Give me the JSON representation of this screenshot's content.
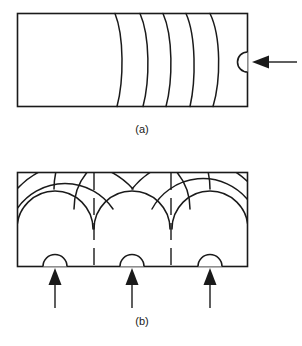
{
  "figure": {
    "background_color": "#ffffff",
    "line_color": "#1a1a1a",
    "panels": [
      {
        "id": "a",
        "caption": "(a)",
        "caption_x": 142,
        "caption_y": 133,
        "description": "Rectangular medium with four curved wavefronts and a single semicircular source on the right edge, with one arrow indicating the incoming direction",
        "box": {
          "x": 17,
          "y": 13,
          "width": 231,
          "height": 94
        },
        "wavefronts": [
          {
            "top_x": 115,
            "mid_x": 118,
            "bottom_x": 117
          },
          {
            "top_x": 140,
            "mid_x": 135,
            "bottom_x": 143
          },
          {
            "top_x": 163,
            "mid_x": 152,
            "bottom_x": 166
          },
          {
            "top_x": 186,
            "mid_x": 168,
            "bottom_x": 190
          },
          {
            "top_x": 210,
            "mid_x": 190,
            "bottom_x": 213
          }
        ],
        "source": {
          "label": "aperture-source",
          "center_x": 248,
          "center_y": 62,
          "radius": 10,
          "bulge": "left"
        },
        "arrows": [
          {
            "label": "incident-arrow",
            "tip_x": 252,
            "tip_y": 62,
            "tail_x": 297,
            "tail_y": 62,
            "direction": "left"
          }
        ]
      },
      {
        "id": "b",
        "caption": "(b)",
        "caption_x": 142,
        "caption_y": 325,
        "description": "Rectangular medium with three semicircular sources on the bottom edge, each emitting three nested circular wavefronts that intersect in cusps along two vertical lines",
        "box": {
          "x": 17,
          "y": 172,
          "width": 231,
          "height": 95
        },
        "sources": [
          {
            "label": "source-1",
            "center_x": 55,
            "center_y": 267,
            "radius": 12,
            "bulge": "up"
          },
          {
            "label": "source-2",
            "center_x": 132,
            "center_y": 267,
            "radius": 12,
            "bulge": "up"
          },
          {
            "label": "source-3",
            "center_x": 210,
            "center_y": 267,
            "radius": 12,
            "bulge": "up"
          }
        ],
        "wavefront_radii": [
          38,
          58,
          78
        ],
        "cusp_lines_x": [
          94,
          171
        ],
        "arrows": [
          {
            "label": "source-arrow-1",
            "tip_x": 55,
            "tip_y": 268,
            "tail_x": 55,
            "tail_y": 308,
            "direction": "up"
          },
          {
            "label": "source-arrow-2",
            "tip_x": 132,
            "tip_y": 268,
            "tail_x": 132,
            "tail_y": 308,
            "direction": "up"
          },
          {
            "label": "source-arrow-3",
            "tip_x": 210,
            "tip_y": 268,
            "tail_x": 210,
            "tail_y": 308,
            "direction": "up"
          }
        ]
      }
    ]
  }
}
